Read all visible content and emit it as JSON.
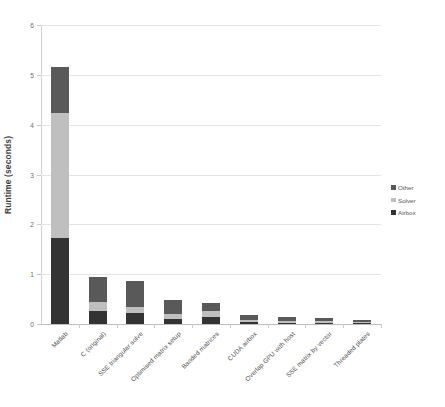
{
  "chart_data": {
    "type": "bar",
    "subtype": "stacked-column",
    "title": "",
    "xlabel": "",
    "ylabel": "Runtime (seconds)",
    "ylim": [
      0,
      6
    ],
    "ytick_values": [
      0,
      1,
      2,
      3,
      4,
      5,
      6
    ],
    "ytick_labels": [
      "0",
      "1",
      "2",
      "3",
      "4",
      "5",
      "6"
    ],
    "grid": true,
    "grid_axis": "y",
    "legend_position": "right",
    "categories": [
      "Matlab",
      "C (original)",
      "SSE triangular solve",
      "Optimised matrix setup",
      "Banded matrices",
      "CUDA airbox",
      "Overlap GPU with host",
      "SSE matrix by vector",
      "Threaded plates"
    ],
    "series": [
      {
        "name": "Airbox",
        "color": "#333333",
        "values": [
          1.72,
          0.27,
          0.23,
          0.11,
          0.14,
          0.04,
          0.03,
          0.03,
          0.02
        ]
      },
      {
        "name": "Solver",
        "color": "#bfbfbf",
        "values": [
          2.52,
          0.17,
          0.11,
          0.09,
          0.12,
          0.05,
          0.04,
          0.03,
          0.02
        ]
      },
      {
        "name": "Other",
        "color": "#595959",
        "values": [
          0.91,
          0.51,
          0.52,
          0.28,
          0.16,
          0.09,
          0.07,
          0.06,
          0.04
        ]
      }
    ],
    "totals": [
      5.15,
      0.95,
      0.86,
      0.48,
      0.42,
      0.18,
      0.14,
      0.12,
      0.08
    ]
  },
  "legend": {
    "entries": [
      {
        "label": "Other",
        "color": "#595959"
      },
      {
        "label": "Solver",
        "color": "#bfbfbf"
      },
      {
        "label": "Airbox",
        "color": "#333333"
      }
    ]
  },
  "axis": {
    "y_title": "Runtime (seconds)"
  }
}
